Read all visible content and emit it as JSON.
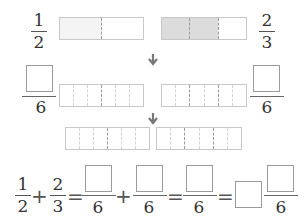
{
  "row1": {
    "left_fraction": {
      "numerator": "1",
      "denominator": "2"
    },
    "right_fraction": {
      "numerator": "2",
      "denominator": "3"
    },
    "left_strip": {
      "parts": 2,
      "shaded": 1
    },
    "right_strip": {
      "parts": 3,
      "shaded": 2
    }
  },
  "row2": {
    "left_fraction": {
      "numerator": "",
      "denominator": "6"
    },
    "right_fraction": {
      "numerator": "",
      "denominator": "6"
    },
    "left_strip": {
      "parts": 6
    },
    "right_strip": {
      "parts": 6
    }
  },
  "row3": {
    "left_strip": {
      "parts": 6
    },
    "right_strip": {
      "parts": 6
    }
  },
  "equation": {
    "term1": {
      "numerator": "1",
      "denominator": "2"
    },
    "plus1": "+",
    "term2": {
      "numerator": "2",
      "denominator": "3"
    },
    "eq1": "=",
    "term3": {
      "numerator": "",
      "denominator": "6"
    },
    "plus2": "+",
    "term4": {
      "numerator": "",
      "denominator": "6"
    },
    "eq2": "=",
    "term5": {
      "numerator": "",
      "denominator": "6"
    },
    "eq3": "=",
    "mixed_whole": "",
    "term6": {
      "numerator": "",
      "denominator": "6"
    }
  },
  "icons": {
    "arrow": "arrow-down-icon"
  },
  "colors": {
    "shaded": "#dcdcdc",
    "border": "#c8c8c8",
    "box_border": "#9a9a9a"
  }
}
